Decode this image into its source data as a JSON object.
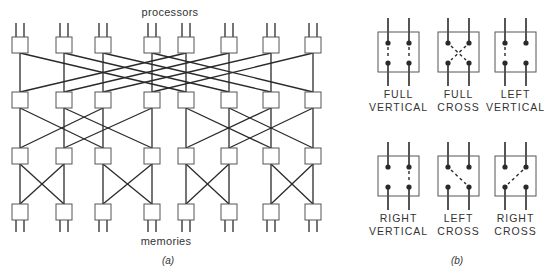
{
  "colors": {
    "line": "#2a2a2a",
    "box_stroke": "#555555",
    "box_fill": "#ffffff",
    "text": "#333333",
    "background": "#ffffff"
  },
  "panel_a": {
    "top_label": "processors",
    "bottom_label": "memories",
    "caption": "(a)",
    "columns_x": [
      20,
      64,
      103,
      152,
      186,
      229,
      271,
      313
    ],
    "rows_y": [
      45,
      100,
      156,
      212
    ],
    "box_size": 16,
    "stages": [
      {
        "from_row": 0,
        "to_row": 1,
        "pairs": [
          [
            0,
            4
          ],
          [
            1,
            5
          ],
          [
            2,
            6
          ],
          [
            3,
            7
          ]
        ]
      },
      {
        "from_row": 1,
        "to_row": 2,
        "pairs": [
          [
            0,
            2
          ],
          [
            1,
            3
          ],
          [
            4,
            6
          ],
          [
            5,
            7
          ]
        ]
      },
      {
        "from_row": 2,
        "to_row": 3,
        "pairs": [
          [
            0,
            1
          ],
          [
            2,
            3
          ],
          [
            4,
            5
          ],
          [
            6,
            7
          ]
        ]
      }
    ]
  },
  "panel_b": {
    "caption": "(b)",
    "switches": [
      {
        "name": "full-vertical",
        "label1": "FULL",
        "label2": "VERTICAL",
        "x": 378,
        "y": 32,
        "solid": [],
        "dashed": [
          "left-vertical",
          "right-vertical"
        ]
      },
      {
        "name": "full-cross",
        "label1": "FULL",
        "label2": "CROSS",
        "x": 438,
        "y": 32,
        "solid": [],
        "dashed": [
          "left-cross",
          "right-cross"
        ]
      },
      {
        "name": "left-vertical",
        "label1": "LEFT",
        "label2": "VERTICAL",
        "x": 495,
        "y": 32,
        "solid": [],
        "dashed": [
          "left-vertical"
        ]
      },
      {
        "name": "right-vertical",
        "label1": "RIGHT",
        "label2": "VERTICAL",
        "x": 378,
        "y": 156,
        "solid": [],
        "dashed": [
          "right-vertical"
        ]
      },
      {
        "name": "left-cross",
        "label1": "LEFT",
        "label2": "CROSS",
        "x": 438,
        "y": 156,
        "solid": [],
        "dashed": [
          "left-cross"
        ]
      },
      {
        "name": "right-cross",
        "label1": "RIGHT",
        "label2": "CROSS",
        "x": 495,
        "y": 156,
        "solid": [],
        "dashed": [
          "right-cross"
        ]
      }
    ]
  }
}
